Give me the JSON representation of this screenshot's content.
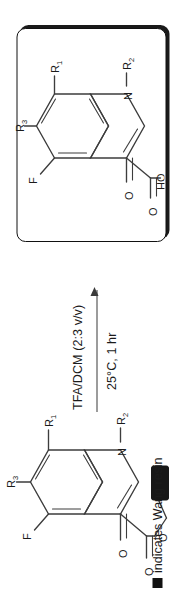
{
  "scheme": {
    "title": "Wang resin cleavage of quinolone ester to carboxylic acid",
    "orientation": "rotated-90-ccw",
    "arrow": {
      "reagent_line_1": "TFA/DCM (2:3 v/v)",
      "reagent_line_2": "25°C, 1 hr",
      "direction": "left-to-right"
    },
    "caption": {
      "marker": "filled-black-square",
      "text": "indicates Wang resin"
    },
    "reactant": {
      "name": "resin-bound-quinolone-ester",
      "atoms": {
        "fluorine": "F",
        "r3": "R",
        "r3_sub": "3",
        "r1": "R",
        "r1_sub": "1",
        "nitrogen": "N",
        "r2": "R",
        "r2_sub": "2",
        "ketone_oxygen": "O",
        "ester_carbonyl_oxygen": "O",
        "ester_ether_oxygen": "O"
      },
      "resin": "wang-resin-bead"
    },
    "product": {
      "name": "free-quinolone-carboxylic-acid",
      "boxed": true,
      "atoms": {
        "fluorine": "F",
        "r3": "R",
        "r3_sub": "3",
        "r1": "R",
        "r1_sub": "1",
        "nitrogen": "N",
        "r2": "R",
        "r2_sub": "2",
        "ketone_oxygen": "O",
        "acid_carbonyl_oxygen": "O",
        "acid_hydroxyl": "HO"
      }
    }
  },
  "colors": {
    "background": "#ffffff",
    "ink": "#1b1b1b",
    "bond": "#3d3d3d",
    "box_border": "#111111",
    "resin_fill": "#171717"
  }
}
